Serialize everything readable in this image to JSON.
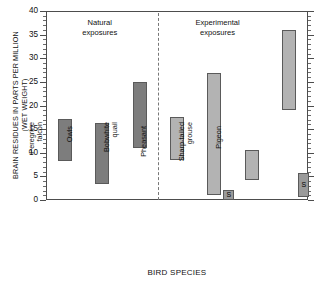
{
  "chart_data": {
    "type": "bar",
    "title": "",
    "xlabel": "BIRD SPECIES",
    "ylabel": "BRAIN RESIDUES IN PARTS PER MILLION (WET WEIGHT)",
    "ylabel_line1": "BRAIN RESIDUES IN PARTS PER MILLION",
    "ylabel_line2": "(WET WEIGHT)",
    "ylim": [
      0,
      40
    ],
    "ytick_values": [
      0,
      5,
      10,
      15,
      20,
      25,
      30,
      35,
      40
    ],
    "ytick_labels": [
      "0",
      "5",
      "10",
      "15",
      "20",
      "25",
      "30",
      "35",
      "40"
    ],
    "minor_tick_step": 1,
    "grid": false,
    "legend": "none",
    "orientation": "vertical",
    "bar_style": "floating-range",
    "categories": [
      "Waterfowl",
      "Peregrine falcon",
      "Owls",
      "Bobwhite quail",
      "Pheasant",
      "Sharp-tailed grouse",
      "Pigeon"
    ],
    "bars": [
      {
        "category": "Waterfowl",
        "label_lines": [
          "Waterfowl"
        ],
        "low": 8.2,
        "high": 17.2,
        "group": "natural",
        "color": "#7d7d7d"
      },
      {
        "category": "Peregrine falcon",
        "label_lines": [
          "Peregrine",
          "falcon"
        ],
        "low": 3.4,
        "high": 16.3,
        "group": "natural",
        "color": "#7d7d7d"
      },
      {
        "category": "Owls",
        "label_lines": [
          "Owls"
        ],
        "low": 10.9,
        "high": 25.0,
        "group": "natural",
        "color": "#7d7d7d"
      },
      {
        "category": "Bobwhite quail",
        "label_lines": [
          "Bobwhite",
          "quail"
        ],
        "low": 8.4,
        "high": 17.6,
        "group": "experimental",
        "color": "#b3b3b3"
      },
      {
        "category": "Pheasant",
        "label_lines": [
          "Pheasant"
        ],
        "low": 1.0,
        "high": 26.9,
        "group": "experimental",
        "color": "#b3b3b3"
      },
      {
        "category": "Sharp-tailed grouse",
        "label_lines": [
          "Sharp-tailed",
          "grouse"
        ],
        "low": 4.2,
        "high": 10.5,
        "group": "experimental",
        "color": "#b3b3b3"
      },
      {
        "category": "Pigeon",
        "label_lines": [
          "Pigeon"
        ],
        "low": 19.0,
        "high": 36.0,
        "group": "experimental",
        "color": "#b3b3b3"
      }
    ],
    "survivor_markers": [
      {
        "category": "Pheasant",
        "symbol": "S",
        "low": 0.0,
        "high": 2.2
      },
      {
        "category": "Pigeon",
        "symbol": "S",
        "low": 0.7,
        "high": 5.7
      }
    ],
    "annotations": [
      {
        "name": "natural-exposures",
        "lines": [
          "Natural",
          "exposures"
        ],
        "x_center_frac": 0.205
      },
      {
        "name": "experimental-exposures",
        "lines": [
          "Experimental",
          "exposures"
        ],
        "x_center_frac": 0.655
      }
    ],
    "group_divider": {
      "after_category": "Owls",
      "style": "dashed"
    }
  }
}
